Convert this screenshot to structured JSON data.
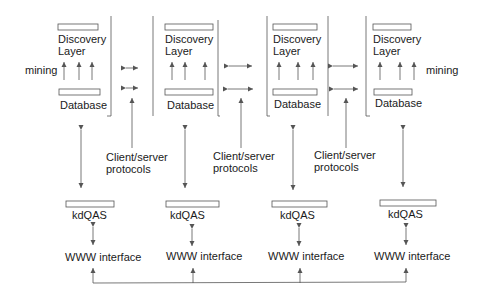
{
  "diagram": {
    "nodes": [
      {
        "discovery_line1": "Discovery",
        "discovery_line2": "Layer",
        "database": "Database",
        "kdqas": "kdQAS",
        "www": "WWW interface"
      },
      {
        "discovery_line1": "Discovery",
        "discovery_line2": "Layer",
        "database": "Database",
        "kdqas": "kdQAS",
        "www": "WWW interface"
      },
      {
        "discovery_line1": "Discovery",
        "discovery_line2": "Layer",
        "database": "Database",
        "kdqas": "kdQAS",
        "www": "WWW interface"
      },
      {
        "discovery_line1": "Discovery",
        "discovery_line2": "Layer",
        "database": "Database",
        "kdqas": "kdQAS",
        "www": "WWW interface"
      }
    ],
    "mining_left": "mining",
    "mining_right": "mining",
    "protocols": [
      {
        "line1": "Client/server",
        "line2": "protocols"
      },
      {
        "line1": "Client/server",
        "line2": "protocols"
      },
      {
        "line1": "Client/server",
        "line2": "protocols"
      }
    ],
    "colors": {
      "line": "#555555",
      "text": "#1a1a1a",
      "background": "#ffffff"
    }
  }
}
